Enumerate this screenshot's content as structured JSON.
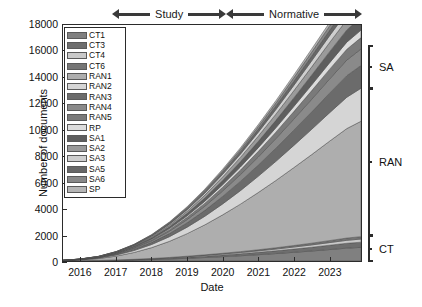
{
  "chart_data": {
    "type": "area",
    "title": "",
    "xlabel": "Date",
    "ylabel": "Number of documents",
    "xlim": [
      2015.5,
      2023.9
    ],
    "ylim": [
      0,
      18000
    ],
    "xticks": [
      "2016",
      "2017",
      "2018",
      "2019",
      "2020",
      "2021",
      "2022",
      "2023"
    ],
    "xtick_values": [
      2016,
      2017,
      2018,
      2019,
      2020,
      2021,
      2022,
      2023
    ],
    "yticks": [
      "0",
      "2000",
      "4000",
      "6000",
      "8000",
      "10000",
      "12000",
      "14000",
      "16000",
      "18000"
    ],
    "ytick_values": [
      0,
      2000,
      4000,
      6000,
      8000,
      10000,
      12000,
      14000,
      16000,
      18000
    ],
    "grid": false,
    "stacked": true,
    "legend_position": "upper-left-inside",
    "x": [
      2015.5,
      2016.0,
      2016.5,
      2017.0,
      2017.5,
      2018.0,
      2018.5,
      2019.0,
      2019.5,
      2020.0,
      2020.5,
      2021.0,
      2021.5,
      2022.0,
      2022.5,
      2023.0,
      2023.5,
      2023.9
    ],
    "series": [
      {
        "name": "CT1",
        "color": "#808080",
        "values": [
          5,
          12,
          25,
          45,
          70,
          105,
          150,
          205,
          265,
          330,
          400,
          480,
          565,
          660,
          760,
          870,
          980,
          1040
        ]
      },
      {
        "name": "CT3",
        "color": "#6e6e6e",
        "values": [
          2,
          5,
          10,
          18,
          28,
          42,
          58,
          78,
          100,
          125,
          152,
          182,
          215,
          250,
          288,
          330,
          372,
          395
        ]
      },
      {
        "name": "CT4",
        "color": "#c9c9c9",
        "values": [
          1,
          3,
          6,
          11,
          17,
          25,
          35,
          47,
          60,
          75,
          92,
          110,
          130,
          152,
          175,
          200,
          226,
          240
        ]
      },
      {
        "name": "CT6",
        "color": "#757575",
        "values": [
          1,
          2,
          4,
          8,
          13,
          19,
          27,
          36,
          46,
          58,
          70,
          84,
          99,
          116,
          133,
          152,
          172,
          183
        ]
      },
      {
        "name": "RAN1",
        "color": "#aeaeae",
        "values": [
          20,
          60,
          140,
          290,
          520,
          830,
          1230,
          1720,
          2290,
          2930,
          3620,
          4360,
          5130,
          5930,
          6740,
          7560,
          8350,
          8800
        ]
      },
      {
        "name": "RAN2",
        "color": "#d5d5d5",
        "values": [
          6,
          18,
          42,
          85,
          150,
          240,
          355,
          495,
          655,
          835,
          1030,
          1240,
          1460,
          1690,
          1925,
          2160,
          2390,
          2520
        ]
      },
      {
        "name": "RAN3",
        "color": "#6b6b6b",
        "values": [
          4,
          12,
          28,
          58,
          102,
          163,
          242,
          338,
          448,
          572,
          706,
          850,
          1002,
          1160,
          1322,
          1486,
          1645,
          1735
        ]
      },
      {
        "name": "RAN4",
        "color": "#8a8a8a",
        "values": [
          3,
          9,
          20,
          42,
          74,
          118,
          175,
          244,
          324,
          414,
          511,
          615,
          725,
          840,
          957,
          1076,
          1191,
          1256
        ]
      },
      {
        "name": "RAN5",
        "color": "#7a7a7a",
        "values": [
          2,
          6,
          14,
          29,
          51,
          82,
          121,
          169,
          224,
          286,
          353,
          425,
          501,
          580,
          661,
          743,
          823,
          868
        ]
      },
      {
        "name": "RP",
        "color": "#dcdcdc",
        "values": [
          1,
          4,
          9,
          19,
          34,
          54,
          80,
          112,
          148,
          189,
          233,
          281,
          331,
          383,
          437,
          491,
          543,
          573
        ]
      },
      {
        "name": "SA1",
        "color": "#5e5e5e",
        "values": [
          2,
          7,
          16,
          33,
          58,
          93,
          138,
          192,
          255,
          325,
          401,
          483,
          569,
          658,
          750,
          843,
          934,
          985
        ]
      },
      {
        "name": "SA2",
        "color": "#9a9a9a",
        "values": [
          2,
          6,
          13,
          27,
          48,
          77,
          114,
          159,
          211,
          269,
          332,
          400,
          471,
          545,
          621,
          698,
          773,
          815
        ]
      },
      {
        "name": "SA3",
        "color": "#cfcfcf",
        "values": [
          1,
          4,
          10,
          20,
          36,
          57,
          85,
          118,
          157,
          200,
          247,
          297,
          350,
          405,
          461,
          518,
          574,
          605
        ]
      },
      {
        "name": "SA5",
        "color": "#676767",
        "values": [
          1,
          3,
          8,
          16,
          28,
          45,
          67,
          93,
          124,
          158,
          195,
          235,
          277,
          320,
          365,
          410,
          454,
          479
        ]
      },
      {
        "name": "SA6",
        "color": "#888888",
        "values": [
          1,
          3,
          6,
          13,
          23,
          37,
          55,
          77,
          102,
          130,
          160,
          193,
          227,
          263,
          300,
          337,
          373,
          394
        ]
      },
      {
        "name": "SP",
        "color": "#b5b5b5",
        "values": [
          1,
          2,
          5,
          10,
          18,
          29,
          43,
          60,
          79,
          101,
          125,
          150,
          177,
          205,
          233,
          262,
          290,
          306
        ]
      }
    ],
    "annotations": {
      "top_arrows": [
        {
          "label": "Study",
          "x_start": 2016.9,
          "x_end": 2020.1
        },
        {
          "label": "Normative",
          "x_start": 2020.1,
          "x_end": 2023.9
        }
      ],
      "right_brackets": [
        {
          "label": "SA",
          "y_start": 13100,
          "y_end": 16400
        },
        {
          "label": "RAN",
          "y_start": 2000,
          "y_end": 13100
        },
        {
          "label": "CT",
          "y_start": 0,
          "y_end": 2000
        }
      ]
    }
  }
}
